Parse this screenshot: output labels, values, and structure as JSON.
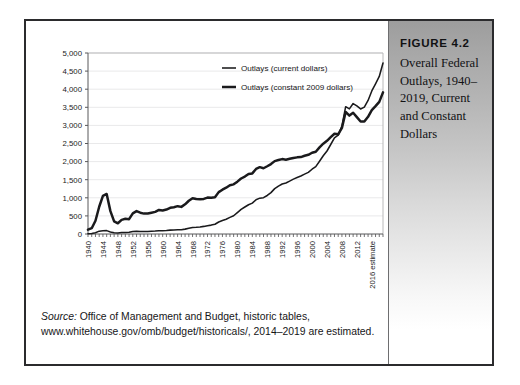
{
  "figure": {
    "number": "FIGURE 4.2",
    "title": "Overall Federal Outlays, 1940–2019, Current and Constant Dollars"
  },
  "source": {
    "label": "Source:",
    "text": " Office of Management and Budget, historic tables, www.whitehouse.gov/omb/budget/historicals/, 2014–2019 are estimated."
  },
  "chart_data": {
    "type": "line",
    "title": "",
    "xlabel": "",
    "ylabel": "",
    "ylim": [
      0,
      5000
    ],
    "yticks": [
      0,
      500,
      1000,
      1500,
      2000,
      2500,
      3000,
      3500,
      4000,
      4500,
      5000
    ],
    "ytick_labels": [
      "0",
      "500",
      "1,000",
      "1,500",
      "2,000",
      "2,500",
      "3,000",
      "3,500",
      "4,000",
      "4,500",
      "5,000"
    ],
    "grid": true,
    "legend_position": "top-center",
    "xlim": [
      1940,
      2019
    ],
    "xtick_labels": [
      "1940",
      "1944",
      "1948",
      "1952",
      "1956",
      "1960",
      "1964",
      "1968",
      "1972",
      "1976",
      "1980",
      "1984",
      "1988",
      "1992",
      "1996",
      "2000",
      "2004",
      "2008",
      "2012",
      "2016 estimate"
    ],
    "xticks": [
      1940,
      1944,
      1948,
      1952,
      1956,
      1960,
      1964,
      1968,
      1972,
      1976,
      1980,
      1984,
      1988,
      1992,
      1996,
      2000,
      2004,
      2008,
      2012,
      2016
    ],
    "x": [
      1940,
      1941,
      1942,
      1943,
      1944,
      1945,
      1946,
      1947,
      1948,
      1949,
      1950,
      1951,
      1952,
      1953,
      1954,
      1955,
      1956,
      1957,
      1958,
      1959,
      1960,
      1961,
      1962,
      1963,
      1964,
      1965,
      1966,
      1967,
      1968,
      1969,
      1970,
      1971,
      1972,
      1973,
      1974,
      1975,
      1976,
      1977,
      1978,
      1979,
      1980,
      1981,
      1982,
      1983,
      1984,
      1985,
      1986,
      1987,
      1988,
      1989,
      1990,
      1991,
      1992,
      1993,
      1994,
      1995,
      1996,
      1997,
      1998,
      1999,
      2000,
      2001,
      2002,
      2003,
      2004,
      2005,
      2006,
      2007,
      2008,
      2009,
      2010,
      2011,
      2012,
      2013,
      2014,
      2015,
      2016,
      2017,
      2018,
      2019
    ],
    "series": [
      {
        "name": "Outlays (current dollars)",
        "units": "billions of current dollars",
        "color": "#1a1a1c",
        "values": [
          9.5,
          13.7,
          35.1,
          78.6,
          91.3,
          92.7,
          55.2,
          34.5,
          29.8,
          38.8,
          42.6,
          45.5,
          67.7,
          76.1,
          70.9,
          68.4,
          70.6,
          76.6,
          82.4,
          92.1,
          92.2,
          97.7,
          106.8,
          111.3,
          118.5,
          118.2,
          134.5,
          157.5,
          178.1,
          183.6,
          195.6,
          210.2,
          230.7,
          245.7,
          269.4,
          332.3,
          371.8,
          409.2,
          458.7,
          504.0,
          590.9,
          678.2,
          745.7,
          808.4,
          851.8,
          946.3,
          990.4,
          1004.0,
          1064.4,
          1143.7,
          1253.0,
          1324.2,
          1381.5,
          1409.4,
          1461.8,
          1515.7,
          1560.5,
          1601.1,
          1652.5,
          1701.8,
          1789.0,
          1862.8,
          2010.9,
          2159.9,
          2292.8,
          2472.0,
          2655.0,
          2728.7,
          2982.5,
          3517.7,
          3457.1,
          3603.1,
          3536.9,
          3454.6,
          3506.1,
          3688.3,
          3951.3,
          4147.2,
          4351.9,
          4725.6
        ]
      },
      {
        "name": "Outlays (constant 2009 dollars)",
        "units": "billions of constant 2009 dollars",
        "color": "#1a1a1c",
        "values": [
          119.1,
          160.2,
          365.4,
          752.5,
          1054.0,
          1105.5,
          631.6,
          347.7,
          296.6,
          391.3,
          420.0,
          409.9,
          569.8,
          632.0,
          589.1,
          563.6,
          565.6,
          589.4,
          611.8,
          664.2,
          650.5,
          676.3,
          723.3,
          740.2,
          768.9,
          749.1,
          820.8,
          918.7,
          989.9,
          966.4,
          960.3,
          969.7,
          1005.3,
          1004.1,
          1014.3,
          1156.5,
          1223.5,
          1279.3,
          1348.1,
          1371.4,
          1445.5,
          1533.1,
          1587.1,
          1658.3,
          1674.3,
          1797.4,
          1846.9,
          1815.9,
          1871.3,
          1932.2,
          2013.5,
          2042.8,
          2069.0,
          2052.0,
          2077.4,
          2100.9,
          2116.9,
          2125.3,
          2160.2,
          2188.0,
          2244.8,
          2273.5,
          2394.2,
          2494.5,
          2574.4,
          2674.4,
          2770.2,
          2753.1,
          2929.5,
          3371.3,
          3271.2,
          3350.2,
          3229.8,
          3106.0,
          3105.4,
          3237.1,
          3421.4,
          3530.8,
          3650.2,
          3912.6
        ]
      }
    ]
  }
}
